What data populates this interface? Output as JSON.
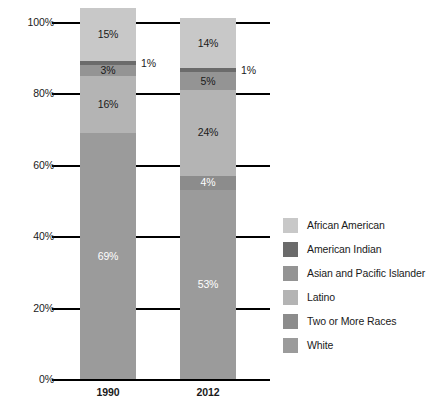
{
  "chart_data": {
    "type": "bar",
    "subtype": "100% stacked column",
    "title": "",
    "subtitle": "",
    "xlabel": "",
    "ylabel": "",
    "categories": [
      "1990",
      "2012"
    ],
    "ylim": [
      0,
      100
    ],
    "ytick_labels": [
      "0%",
      "20%",
      "40%",
      "60%",
      "80%",
      "100%"
    ],
    "ytick_values": [
      0,
      20,
      40,
      60,
      80,
      100
    ],
    "grid": true,
    "legend_position": "right",
    "series": [
      {
        "name": "African American",
        "color": "#c8c8c8",
        "values": [
          15,
          14
        ],
        "labels": [
          "15%",
          "14%"
        ],
        "label_color": "#1a1a1a",
        "label_placement": "inside"
      },
      {
        "name": "American Indian",
        "color": "#6b6b6b",
        "values": [
          1,
          1
        ],
        "labels": [
          "1%",
          "1%"
        ],
        "label_color": "#1a1a1a",
        "label_placement": "outside"
      },
      {
        "name": "Asian and Pacific Islander",
        "color": "#949494",
        "values": [
          3,
          5
        ],
        "labels": [
          "3%",
          "5%"
        ],
        "label_color": "#1a1a1a",
        "label_placement": "inside"
      },
      {
        "name": "Latino",
        "color": "#b4b4b4",
        "values": [
          16,
          24
        ],
        "labels": [
          "16%",
          "24%"
        ],
        "label_color": "#1a1a1a",
        "label_placement": "inside"
      },
      {
        "name": "Two or More Races",
        "color": "#8c8c8c",
        "values": [
          0,
          4
        ],
        "labels": [
          "",
          "4%"
        ],
        "label_color": "#ffffff",
        "label_placement": "inside"
      },
      {
        "name": "White",
        "color": "#9b9b9b",
        "values": [
          69,
          53
        ],
        "labels": [
          "69%",
          "53%"
        ],
        "label_color": "#ffffff",
        "label_placement": "inside"
      }
    ],
    "stack_order_bottom_to_top": [
      "White",
      "Two or More Races",
      "Latino",
      "Asian and Pacific Islander",
      "American Indian",
      "African American"
    ],
    "axis_color": "#000000",
    "background_color": "#ffffff"
  },
  "legend": {
    "items": [
      {
        "label": "African American",
        "color": "#c8c8c8"
      },
      {
        "label": "American Indian",
        "color": "#6b6b6b"
      },
      {
        "label": "Asian and Pacific Islander",
        "color": "#949494"
      },
      {
        "label": "Latino",
        "color": "#b4b4b4"
      },
      {
        "label": "Two or More Races",
        "color": "#8c8c8c"
      },
      {
        "label": "White",
        "color": "#9b9b9b"
      }
    ]
  }
}
